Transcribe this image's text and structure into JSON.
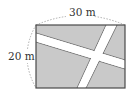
{
  "figure": {
    "width_label": "30 m",
    "height_label": "20 m",
    "colors": {
      "field": "#c9c9c9",
      "road": "#ffffff",
      "border": "#4a4a4a",
      "dashed_arc": "#999999",
      "text": "#333333"
    }
  }
}
